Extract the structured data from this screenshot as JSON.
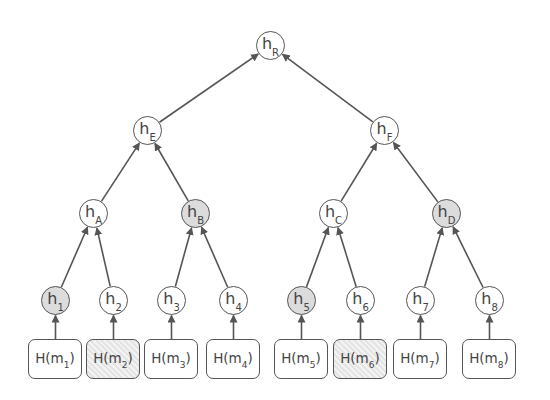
{
  "diagram": {
    "type": "merkle-tree",
    "colors": {
      "stroke": "#555555",
      "text": "#444444",
      "shaded_fill": "#dcdcdc",
      "background": "#ffffff"
    },
    "root": {
      "id": "hR",
      "base": "h",
      "sub": "R",
      "shaded": false
    },
    "level1": [
      {
        "id": "hE",
        "base": "h",
        "sub": "E",
        "shaded": false
      },
      {
        "id": "hF",
        "base": "h",
        "sub": "F",
        "shaded": false
      }
    ],
    "level2": [
      {
        "id": "hA",
        "base": "h",
        "sub": "A",
        "shaded": false
      },
      {
        "id": "hB",
        "base": "h",
        "sub": "B",
        "shaded": true
      },
      {
        "id": "hC",
        "base": "h",
        "sub": "C",
        "shaded": false
      },
      {
        "id": "hD",
        "base": "h",
        "sub": "D",
        "shaded": true
      }
    ],
    "leaves": [
      {
        "id": "h1",
        "base": "h",
        "sub": "1",
        "shaded": true
      },
      {
        "id": "h2",
        "base": "h",
        "sub": "2",
        "shaded": false
      },
      {
        "id": "h3",
        "base": "h",
        "sub": "3",
        "shaded": false
      },
      {
        "id": "h4",
        "base": "h",
        "sub": "4",
        "shaded": false
      },
      {
        "id": "h5",
        "base": "h",
        "sub": "5",
        "shaded": true
      },
      {
        "id": "h6",
        "base": "h",
        "sub": "6",
        "shaded": false
      },
      {
        "id": "h7",
        "base": "h",
        "sub": "7",
        "shaded": false
      },
      {
        "id": "h8",
        "base": "h",
        "sub": "8",
        "shaded": false
      }
    ],
    "messages": [
      {
        "prefix": "H(m",
        "sub": "1",
        "suffix": ")",
        "shaded": false
      },
      {
        "prefix": "H(m",
        "sub": "2",
        "suffix": ")",
        "shaded": true
      },
      {
        "prefix": "H(m",
        "sub": "3",
        "suffix": ")",
        "shaded": false
      },
      {
        "prefix": "H(m",
        "sub": "4",
        "suffix": ")",
        "shaded": false
      },
      {
        "prefix": "H(m",
        "sub": "5",
        "suffix": ")",
        "shaded": false
      },
      {
        "prefix": "H(m",
        "sub": "6",
        "suffix": ")",
        "shaded": true
      },
      {
        "prefix": "H(m",
        "sub": "7",
        "suffix": ")",
        "shaded": false
      },
      {
        "prefix": "H(m",
        "sub": "8",
        "suffix": ")",
        "shaded": false
      }
    ],
    "edges": [
      [
        "hE",
        "hR"
      ],
      [
        "hF",
        "hR"
      ],
      [
        "hA",
        "hE"
      ],
      [
        "hB",
        "hE"
      ],
      [
        "hC",
        "hF"
      ],
      [
        "hD",
        "hF"
      ],
      [
        "h1",
        "hA"
      ],
      [
        "h2",
        "hA"
      ],
      [
        "h3",
        "hB"
      ],
      [
        "h4",
        "hB"
      ],
      [
        "h5",
        "hC"
      ],
      [
        "h6",
        "hC"
      ],
      [
        "h7",
        "hD"
      ],
      [
        "h8",
        "hD"
      ]
    ]
  }
}
